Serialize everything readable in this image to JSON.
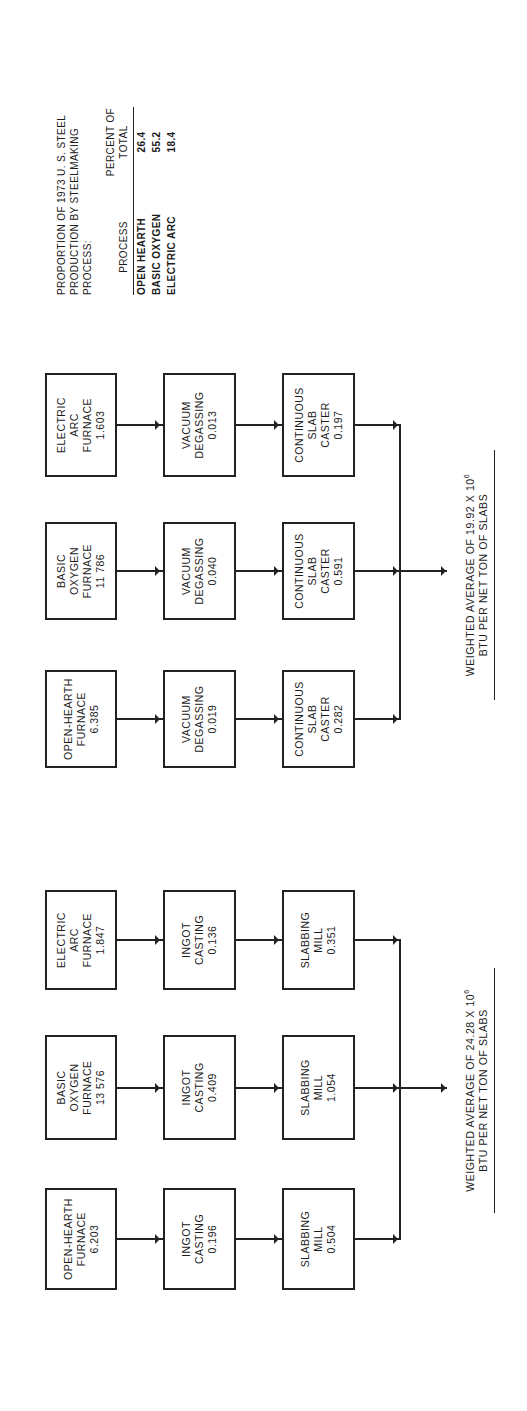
{
  "legend": {
    "title_lines": [
      "PROPORTION OF 1973 U. S. STEEL",
      "PRODUCTION BY STEELMAKING",
      "PROCESS:"
    ],
    "headers": {
      "process": "PROCESS",
      "percent_line1": "PERCENT OF",
      "percent_line2": "TOTAL"
    },
    "rows": [
      {
        "process": "OPEN HEARTH",
        "percent": "26.4"
      },
      {
        "process": "BASIC OXYGEN",
        "percent": "55.2"
      },
      {
        "process": "ELECTRIC ARC",
        "percent": "18.4"
      }
    ]
  },
  "groups": [
    {
      "id": "ingot-route",
      "chains": [
        {
          "furnace": [
            "OPEN-HEARTH",
            "FURNACE",
            "6.203"
          ],
          "step2": [
            "INGOT",
            "CASTING",
            "0.196"
          ],
          "step3": [
            "SLABBING",
            "MILL",
            "0.504"
          ]
        },
        {
          "furnace": [
            "BASIC",
            "OXYGEN",
            "FURNACE",
            "13 576"
          ],
          "step2": [
            "INGOT",
            "CASTING",
            "0.409"
          ],
          "step3": [
            "SLABBING",
            "MILL",
            "1.054"
          ]
        },
        {
          "furnace": [
            "ELECTRIC",
            "ARC",
            "FURNACE",
            "1.847"
          ],
          "step2": [
            "INGOT",
            "CASTING",
            "0.136"
          ],
          "step3": [
            "SLABBING",
            "MILL",
            "0.351"
          ]
        }
      ],
      "weighted_line1": "WEIGHTED AVERAGE OF 24.28 X 10",
      "weighted_exp": "6",
      "weighted_line2": "BTU PER NET TON OF SLABS"
    },
    {
      "id": "continuous-casting-route",
      "chains": [
        {
          "furnace": [
            "OPEN-HEARTH",
            "FURNACE",
            "6.385"
          ],
          "step2": [
            "VACUUM",
            "DEGASSING",
            "0.019"
          ],
          "step3": [
            "CONTINUOUS",
            "SLAB",
            "CASTER",
            "0.282"
          ]
        },
        {
          "furnace": [
            "BASIC",
            "OXYGEN",
            "FURNACE",
            "11 786"
          ],
          "step2": [
            "VACUUM",
            "DEGASSING",
            "0.040"
          ],
          "step3": [
            "CONTINUOUS",
            "SLAB",
            "CASTER",
            "0.591"
          ]
        },
        {
          "furnace": [
            "ELECTRIC",
            "ARC",
            "FURNACE",
            "1.603"
          ],
          "step2": [
            "VACUUM",
            "DEGASSING",
            "0.013"
          ],
          "step3": [
            "CONTINUOUS",
            "SLAB",
            "CASTER",
            "0.197"
          ]
        }
      ],
      "weighted_line1": "WEIGHTED AVERAGE OF 19.92 X 10",
      "weighted_exp": "6",
      "weighted_line2": "BTU PER NET TON OF SLABS"
    }
  ],
  "colors": {
    "ink": "#222222",
    "background": "#ffffff"
  }
}
